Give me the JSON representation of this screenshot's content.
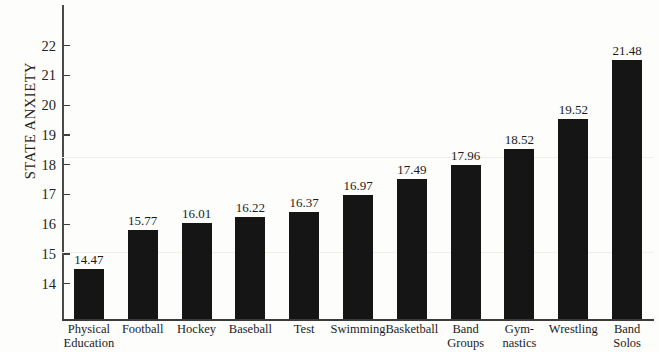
{
  "chart_data": {
    "type": "bar",
    "title": "",
    "xlabel": "",
    "ylabel": "STATE ANXIETY",
    "ylim": [
      13.5,
      22.6
    ],
    "grid": false,
    "legend": null,
    "y_ticks": [
      14,
      15,
      16,
      17,
      18,
      19,
      20,
      21,
      22
    ],
    "y_tick_labels": [
      "14",
      "15",
      "16",
      "17",
      "18",
      "19",
      "20",
      "21",
      "22"
    ],
    "categories": [
      "Physical\nEducation",
      "Football",
      "Hockey",
      "Baseball",
      "Test",
      "Swimming",
      "Basketball",
      "Band\nGroups",
      "Gym-\nnastics",
      "Wrestling",
      "Band\nSolos"
    ],
    "values": [
      14.47,
      15.77,
      16.01,
      16.22,
      16.37,
      16.97,
      17.49,
      17.96,
      18.52,
      19.52,
      21.48
    ],
    "value_labels": [
      "14.47",
      "15.77",
      "16.01",
      "16.22",
      "16.37",
      "16.97",
      "17.49",
      "17.96",
      "18.52",
      "19.52",
      "21.48"
    ],
    "bar_color": "#151515",
    "axis_color": "#3f3f3f",
    "background_color": "#fdfdfb"
  }
}
